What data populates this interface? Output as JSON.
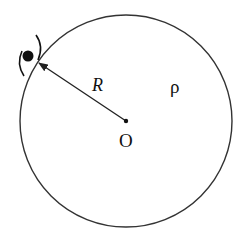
{
  "diagram": {
    "type": "physics-figure",
    "labels": {
      "radius": "R",
      "density": "ρ",
      "center": "O"
    },
    "colors": {
      "stroke": "#333333",
      "text": "#111111",
      "particle": "#111111",
      "background": "#ffffff"
    },
    "geometry": {
      "circle_center": [
        126,
        121
      ],
      "circle_radius": 106,
      "particle_position": [
        27,
        55
      ],
      "arrow_from": [
        126,
        121
      ],
      "arrow_to": [
        38,
        62
      ]
    }
  }
}
